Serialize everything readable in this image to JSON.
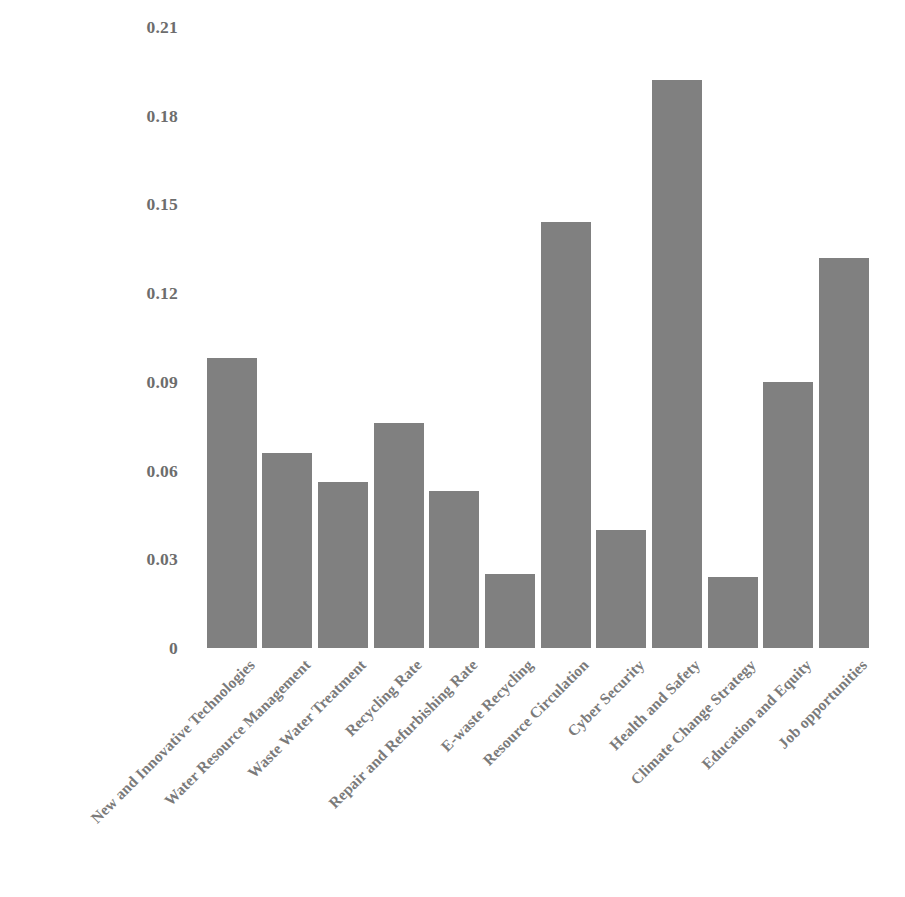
{
  "chart_data": {
    "type": "bar",
    "title": "",
    "xlabel": "",
    "ylabel": "",
    "ylim": [
      0,
      0.21
    ],
    "grid": false,
    "legend": "none",
    "bar_color": "#808080",
    "tick_label_color": "#7a7a7a",
    "y_ticks": [
      "0",
      "0.03",
      "0.06",
      "0.09",
      "0.12",
      "0.15",
      "0.18",
      "0.21"
    ],
    "y_tick_values": [
      0,
      0.03,
      0.06,
      0.09,
      0.12,
      0.15,
      0.18,
      0.21
    ],
    "categories": [
      "New and Innovative Technologies",
      "Water Resource Management",
      "Waste Water Treatment",
      "Recycling Rate",
      "Repair and Refurbishing Rate",
      "E-waste Recycling",
      "Resource Circulation",
      "Cyber Security",
      "Health and Safety",
      "Climate Change Strategy",
      "Education and Equity",
      "Job opportunities"
    ],
    "values": [
      0.098,
      0.066,
      0.056,
      0.076,
      0.053,
      0.025,
      0.144,
      0.04,
      0.192,
      0.024,
      0.09,
      0.132
    ]
  }
}
